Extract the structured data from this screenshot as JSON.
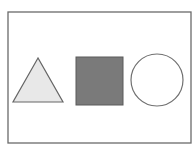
{
  "diagram": {
    "frame": {
      "x": 8,
      "y": 12,
      "width": 183,
      "height": 131,
      "stroke": "#6a6a6a"
    },
    "shapes": [
      {
        "type": "triangle",
        "points": "38,58 13,102 63,102",
        "fill": "#e8e8e8",
        "stroke": "#666666"
      },
      {
        "type": "square",
        "x": 76,
        "y": 57,
        "width": 47,
        "height": 48,
        "fill": "#7a7a7a",
        "stroke": "#5a5a5a"
      },
      {
        "type": "circle",
        "cx": 157,
        "cy": 80,
        "r": 26,
        "fill": "#ffffff",
        "stroke": "#707070"
      }
    ]
  }
}
